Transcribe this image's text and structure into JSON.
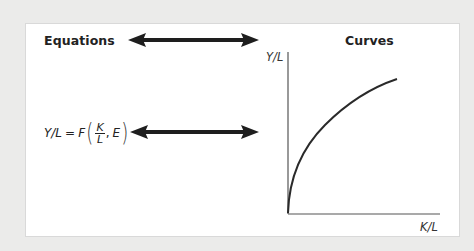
{
  "headings": {
    "equations": "Equations",
    "curves": "Curves"
  },
  "equation": {
    "lhs": "Y/L",
    "equals": "=",
    "function": "F",
    "fraction_numerator": "K",
    "fraction_denominator": "L",
    "comma": ",",
    "extra_arg": "E"
  },
  "arrows": [
    {
      "name": "heading-double-arrow",
      "type": "bidirectional",
      "connects": [
        "Equations",
        "Curves"
      ]
    },
    {
      "name": "equation-double-arrow",
      "type": "bidirectional",
      "connects": [
        "Y/L = F(K/L, E)",
        "curve"
      ]
    }
  ],
  "graph": {
    "y_axis_label": "Y/L",
    "x_axis_label": "K/L",
    "curve_shape": "concave increasing from origin"
  },
  "colors": {
    "background": "#ebebea",
    "panel": "#ffffff",
    "ink": "#222222"
  }
}
